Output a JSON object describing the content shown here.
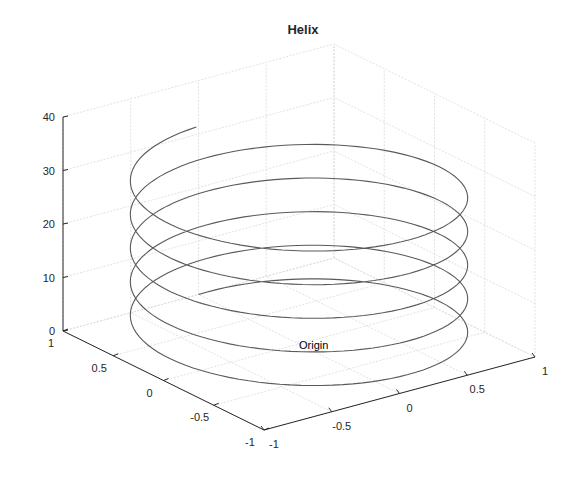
{
  "chart_data": {
    "type": "line3d",
    "title": "Helix",
    "xlabel": "",
    "ylabel": "",
    "zlabel": "",
    "grid": true,
    "legend": null,
    "xlim": [
      -1,
      1
    ],
    "ylim": [
      -1,
      1
    ],
    "zlim": [
      0,
      40
    ],
    "x_ticks": [
      "-1",
      "-0.5",
      "0",
      "0.5",
      "1"
    ],
    "y_ticks": [
      "-1",
      "-0.5",
      "0",
      "0.5",
      "1"
    ],
    "z_ticks": [
      "0",
      "10",
      "20",
      "30",
      "40"
    ],
    "series": [
      {
        "name": "helix",
        "equation": "x = sin(t), y = cos(t), z = t",
        "t_range": [
          0,
          31.4159
        ],
        "t_step": 0.0628,
        "color": "#5a5a5a"
      }
    ],
    "annotations": [
      {
        "text": "Origin",
        "x": 0,
        "y": 0,
        "z": 0
      }
    ]
  }
}
